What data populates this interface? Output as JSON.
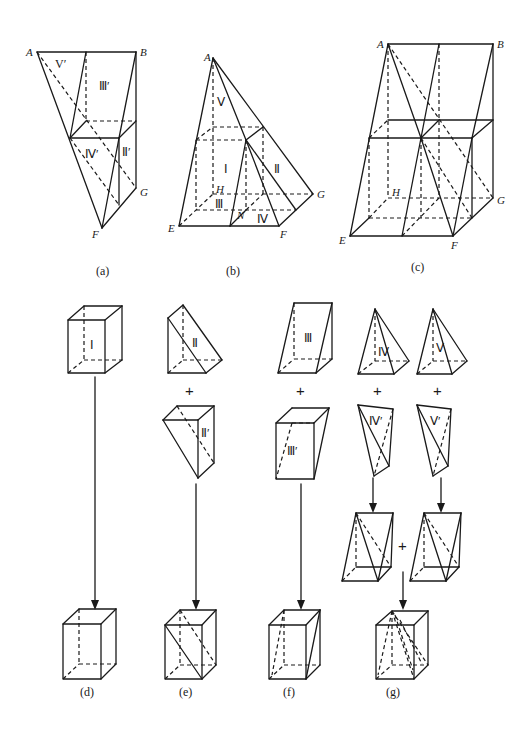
{
  "figure": {
    "captions": {
      "a": "(a)",
      "b": "(b)",
      "c": "(c)",
      "d": "(d)",
      "e": "(e)",
      "f": "(f)",
      "g": "(g)"
    },
    "vertex_labels": {
      "a": {
        "A": "A",
        "B": "B",
        "F": "F",
        "G": "G"
      },
      "b": {
        "A": "A",
        "E": "E",
        "F": "F",
        "G": "G",
        "H": "H",
        "N": "N"
      },
      "c": {
        "A": "A",
        "B": "B",
        "E": "E",
        "F": "F",
        "G": "G",
        "H": "H"
      }
    },
    "piece_labels": {
      "a": {
        "V_prime": "V′",
        "III_prime": "Ⅲ′",
        "IV_prime": "Ⅳ′",
        "II_prime": "Ⅱ′"
      },
      "b": {
        "V": "Ⅴ",
        "I": "Ⅰ",
        "II": "Ⅱ",
        "III": "Ⅲ",
        "IV": "Ⅳ"
      },
      "d": {
        "I": "Ⅰ"
      },
      "e": {
        "II": "Ⅱ",
        "II_prime": "Ⅱ′"
      },
      "f": {
        "III": "Ⅲ",
        "III_prime": "Ⅲ′"
      },
      "g": {
        "IV": "Ⅳ",
        "V": "Ⅴ",
        "IV_prime": "Ⅳ′",
        "V_prime": "Ⅴ′"
      }
    },
    "operators": {
      "plus": "+"
    },
    "colors": {
      "stroke": "#1a1a1a",
      "background": "#ffffff"
    }
  }
}
